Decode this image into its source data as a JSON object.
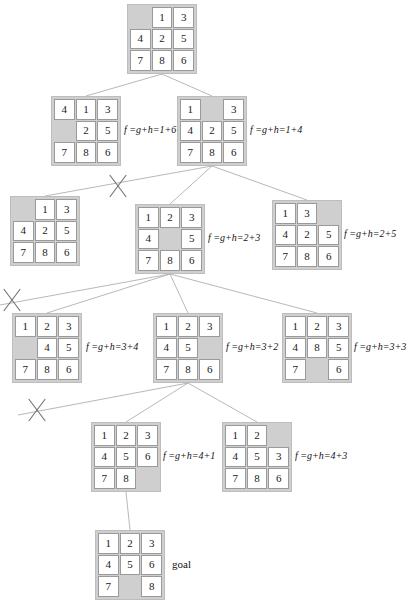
{
  "diagram": {
    "goal_label": "goal",
    "blank_symbol": "",
    "nodes": [
      {
        "id": "n0",
        "level": 0,
        "x": 127,
        "y": 4,
        "tiles": [
          "",
          "1",
          "3",
          "4",
          "2",
          "5",
          "7",
          "8",
          "6"
        ],
        "f_label": "",
        "label_x": 0,
        "label_y": 0
      },
      {
        "id": "n1",
        "level": 1,
        "x": 51,
        "y": 96,
        "tiles": [
          "4",
          "1",
          "3",
          "",
          "2",
          "5",
          "7",
          "8",
          "6"
        ],
        "f_label": "f =g+h=1+6",
        "label_x": 124,
        "label_y": 124
      },
      {
        "id": "n2",
        "level": 1,
        "x": 177,
        "y": 96,
        "tiles": [
          "1",
          "",
          "3",
          "4",
          "2",
          "5",
          "7",
          "8",
          "6"
        ],
        "f_label": "f =g+h=1+4",
        "label_x": 250,
        "label_y": 124
      },
      {
        "id": "n3",
        "level": 2,
        "x": 10,
        "y": 196,
        "tiles": [
          "",
          "1",
          "3",
          "4",
          "2",
          "5",
          "7",
          "8",
          "6"
        ],
        "f_label": "",
        "label_x": 0,
        "label_y": 0
      },
      {
        "id": "n4",
        "level": 2,
        "x": 135,
        "y": 204,
        "tiles": [
          "1",
          "2",
          "3",
          "4",
          "",
          "5",
          "7",
          "8",
          "6"
        ],
        "f_label": "f =g+h=2+3",
        "label_x": 208,
        "label_y": 232
      },
      {
        "id": "n5",
        "level": 2,
        "x": 272,
        "y": 200,
        "tiles": [
          "1",
          "3",
          "",
          "4",
          "2",
          "5",
          "7",
          "8",
          "6"
        ],
        "f_label": "f =g+h=2+5",
        "label_x": 344,
        "label_y": 228
      },
      {
        "id": "n6",
        "level": 3,
        "x": 12,
        "y": 313,
        "tiles": [
          "1",
          "2",
          "3",
          "",
          "4",
          "5",
          "7",
          "8",
          "6"
        ],
        "f_label": "f =g+h=3+4",
        "label_x": 86,
        "label_y": 341
      },
      {
        "id": "n7",
        "level": 3,
        "x": 153,
        "y": 313,
        "tiles": [
          "1",
          "2",
          "3",
          "4",
          "5",
          "",
          "7",
          "8",
          "6"
        ],
        "f_label": "f =g+h=3+2",
        "label_x": 226,
        "label_y": 341
      },
      {
        "id": "n8",
        "level": 3,
        "x": 282,
        "y": 313,
        "tiles": [
          "1",
          "2",
          "3",
          "4",
          "8",
          "5",
          "7",
          "",
          "6"
        ],
        "f_label": "f =g+h=3+3",
        "label_x": 354,
        "label_y": 341
      },
      {
        "id": "n9",
        "level": 4,
        "x": 91,
        "y": 422,
        "tiles": [
          "1",
          "2",
          "3",
          "4",
          "5",
          "6",
          "7",
          "8",
          ""
        ],
        "f_label": "f =g+h=4+1",
        "label_x": 163,
        "label_y": 450
      },
      {
        "id": "n10",
        "level": 4,
        "x": 222,
        "y": 422,
        "tiles": [
          "1",
          "2",
          "",
          "4",
          "5",
          "3",
          "7",
          "8",
          "6"
        ],
        "f_label": "f =g+h=4+3",
        "label_x": 295,
        "label_y": 450
      },
      {
        "id": "n11",
        "level": 5,
        "x": 95,
        "y": 530,
        "tiles": [
          "1",
          "2",
          "3",
          "4",
          "5",
          "6",
          "7",
          "",
          "8"
        ],
        "f_label": "",
        "label_x": 0,
        "label_y": 0,
        "is_goal": true,
        "goal_label_x": 172,
        "goal_label_y": 558
      }
    ],
    "edges": [
      {
        "from": "n0",
        "to": "n1",
        "x1": 162,
        "y1": 74,
        "x2": 86,
        "y2": 96
      },
      {
        "from": "n0",
        "to": "n2",
        "x1": 162,
        "y1": 74,
        "x2": 212,
        "y2": 96
      },
      {
        "from": "n2",
        "to": "n3",
        "x1": 212,
        "y1": 166,
        "x2": 45,
        "y2": 196
      },
      {
        "from": "n2",
        "to": "n4",
        "x1": 212,
        "y1": 166,
        "x2": 170,
        "y2": 204
      },
      {
        "from": "n2",
        "to": "n5",
        "x1": 212,
        "y1": 166,
        "x2": 307,
        "y2": 200
      },
      {
        "from": "n4",
        "to": "x-left",
        "x1": 170,
        "y1": 274,
        "x2": 0,
        "y2": 305
      },
      {
        "from": "n4",
        "to": "n6",
        "x1": 170,
        "y1": 274,
        "x2": 47,
        "y2": 313
      },
      {
        "from": "n4",
        "to": "n7",
        "x1": 170,
        "y1": 274,
        "x2": 188,
        "y2": 313
      },
      {
        "from": "n4",
        "to": "n8",
        "x1": 170,
        "y1": 274,
        "x2": 317,
        "y2": 313
      },
      {
        "from": "n7",
        "to": "x-left2",
        "x1": 188,
        "y1": 383,
        "x2": 18,
        "y2": 415
      },
      {
        "from": "n7",
        "to": "n9",
        "x1": 188,
        "y1": 383,
        "x2": 126,
        "y2": 422
      },
      {
        "from": "n7",
        "to": "n10",
        "x1": 188,
        "y1": 383,
        "x2": 257,
        "y2": 422
      },
      {
        "from": "n9",
        "to": "n11",
        "x1": 126,
        "y1": 492,
        "x2": 130,
        "y2": 530
      }
    ],
    "x_marks": [
      {
        "id": "x1",
        "cx": 118,
        "cy": 186
      },
      {
        "id": "x2",
        "cx": 12,
        "cy": 300
      },
      {
        "id": "x3",
        "cx": 37,
        "cy": 410
      }
    ]
  }
}
